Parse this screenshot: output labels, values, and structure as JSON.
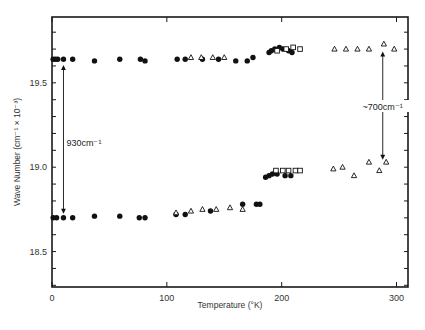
{
  "chart_data": {
    "type": "scatter",
    "title": "",
    "xlabel": "Temperature (°K)",
    "ylabel": "Wave Number (cm⁻¹ × 10⁻³)",
    "xlim": [
      0,
      310
    ],
    "ylim": [
      18.29,
      19.89
    ],
    "x_ticks": [
      0,
      100,
      200,
      300
    ],
    "y_ticks": [
      18.5,
      19.0,
      19.5
    ],
    "grid": false,
    "legend": null,
    "annotations": [
      {
        "text": "930cm⁻¹",
        "x": 10,
        "y_from": 19.63,
        "y_to": 18.7,
        "type": "double-arrow"
      },
      {
        "text": "~700cm⁻¹",
        "x": 288,
        "y_from": 19.71,
        "y_to": 19.02,
        "type": "double-arrow"
      }
    ],
    "series": [
      {
        "name": "filled circles (upper band)",
        "marker": "circle-filled",
        "points": [
          [
            1,
            19.64
          ],
          [
            3,
            19.64
          ],
          [
            5,
            19.64
          ],
          [
            10,
            19.64
          ],
          [
            18,
            19.64
          ],
          [
            37,
            19.63
          ],
          [
            59,
            19.64
          ],
          [
            77,
            19.64
          ],
          [
            81,
            19.63
          ],
          [
            109,
            19.64
          ],
          [
            116,
            19.64
          ],
          [
            131,
            19.64
          ],
          [
            145,
            19.64
          ],
          [
            160,
            19.63
          ],
          [
            170,
            19.63
          ],
          [
            175,
            19.65
          ],
          [
            189,
            19.68
          ],
          [
            191,
            19.69
          ],
          [
            194,
            19.7
          ],
          [
            198,
            19.71
          ],
          [
            201,
            19.7
          ],
          [
            206,
            19.69
          ],
          [
            209,
            19.68
          ]
        ]
      },
      {
        "name": "open triangles (upper band)",
        "marker": "triangle-open",
        "points": [
          [
            121,
            19.65
          ],
          [
            130,
            19.65
          ],
          [
            140,
            19.65
          ],
          [
            150,
            19.65
          ],
          [
            246,
            19.7
          ],
          [
            256,
            19.7
          ],
          [
            266,
            19.7
          ],
          [
            276,
            19.7
          ],
          [
            289,
            19.73
          ],
          [
            298,
            19.7
          ]
        ]
      },
      {
        "name": "open squares (upper band)",
        "marker": "square-open",
        "points": [
          [
            196,
            19.69
          ],
          [
            204,
            19.7
          ],
          [
            210,
            19.71
          ],
          [
            216,
            19.7
          ]
        ]
      },
      {
        "name": "filled circles (lower band)",
        "marker": "circle-filled",
        "points": [
          [
            1,
            18.7
          ],
          [
            4,
            18.7
          ],
          [
            10,
            18.7
          ],
          [
            18,
            18.7
          ],
          [
            37,
            18.71
          ],
          [
            59,
            18.71
          ],
          [
            76,
            18.7
          ],
          [
            81,
            18.7
          ],
          [
            108,
            18.72
          ],
          [
            116,
            18.72
          ],
          [
            138,
            18.74
          ],
          [
            166,
            18.78
          ],
          [
            178,
            18.78
          ],
          [
            181,
            18.78
          ],
          [
            186,
            18.94
          ],
          [
            189,
            18.95
          ],
          [
            192,
            18.96
          ],
          [
            196,
            18.96
          ],
          [
            203,
            18.95
          ],
          [
            208,
            18.95
          ]
        ]
      },
      {
        "name": "open triangles (lower band)",
        "marker": "triangle-open",
        "points": [
          [
            108,
            18.73
          ],
          [
            121,
            18.74
          ],
          [
            131,
            18.75
          ],
          [
            143,
            18.75
          ],
          [
            155,
            18.76
          ],
          [
            166,
            18.75
          ],
          [
            245,
            18.99
          ],
          [
            253,
            19.0
          ],
          [
            263,
            18.95
          ],
          [
            276,
            19.03
          ],
          [
            285,
            18.98
          ],
          [
            291,
            19.03
          ]
        ]
      },
      {
        "name": "open squares (lower band)",
        "marker": "square-open",
        "points": [
          [
            195,
            18.98
          ],
          [
            201,
            18.98
          ],
          [
            206,
            18.98
          ],
          [
            212,
            18.98
          ],
          [
            216,
            18.98
          ]
        ]
      }
    ]
  },
  "labels": {
    "x_axis_title": "Temperature (°K)",
    "y_axis_title": "Wave Number (cm⁻¹ × 10⁻³)",
    "annotation_left": "930cm⁻¹",
    "annotation_right": "~700cm⁻¹",
    "x_tick_labels": [
      "0",
      "100",
      "200",
      "300"
    ],
    "y_tick_labels": [
      "18.5",
      "19.0",
      "19.5"
    ]
  }
}
